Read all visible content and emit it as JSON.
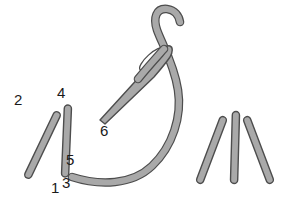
{
  "figure": {
    "background_color": "#ffffff",
    "stroke_fill_color": "#a9a9a9",
    "stroke_outline_color": "#4d4d4d",
    "label_color": "#1a1a1a"
  },
  "labels": [
    {
      "id": "label-2",
      "text": "2",
      "x": 14,
      "y": 92
    },
    {
      "id": "label-4",
      "text": "4",
      "x": 57,
      "y": 85
    },
    {
      "id": "label-5",
      "text": "5",
      "x": 66,
      "y": 152
    },
    {
      "id": "label-1",
      "text": "1",
      "x": 51,
      "y": 180
    },
    {
      "id": "label-3",
      "text": "3",
      "x": 62,
      "y": 175
    },
    {
      "id": "label-6",
      "text": "6",
      "x": 100,
      "y": 123
    }
  ],
  "left_group": {
    "name": "partially-completed-stitches",
    "strokes": [
      {
        "id": "stroke-2-1",
        "from_point": "2",
        "to_point": "1",
        "x1": 27,
        "y1": 112,
        "x2": 58,
        "y2": 178
      },
      {
        "id": "stroke-4-3",
        "from_point": "4",
        "to_point": "3",
        "x1": 65,
        "y1": 105,
        "x2": 68,
        "y2": 177
      }
    ]
  },
  "right_group": {
    "name": "completed-stitches",
    "strokes": [
      {
        "id": "stroke-r1",
        "x1": 199,
        "y1": 117,
        "x2": 224,
        "y2": 183
      },
      {
        "id": "stroke-r2",
        "x1": 234,
        "y1": 112,
        "x2": 236,
        "y2": 183
      },
      {
        "id": "stroke-r3",
        "x1": 271,
        "y1": 117,
        "x2": 246,
        "y2": 183
      }
    ]
  },
  "needle": {
    "name": "curved-suture-needle",
    "tip_point": "6",
    "tip_x": 100,
    "tip_y": 120,
    "eye_x": 152,
    "eye_y": 58
  },
  "thread": {
    "name": "suture-thread",
    "emerges_at_point": "5",
    "start_x": 72,
    "start_y": 176
  }
}
